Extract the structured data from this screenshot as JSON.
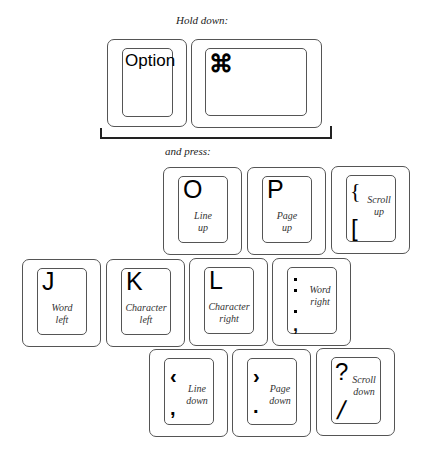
{
  "captions": {
    "hold_down": "Hold down:",
    "and_press": "and press:"
  },
  "modifiers": [
    {
      "id": "option",
      "label": "Option"
    },
    {
      "id": "command",
      "label": "⌘",
      "icon": "command-icon"
    }
  ],
  "keys": {
    "o": {
      "glyph": "O",
      "action_line1": "Line",
      "action_line2": "up"
    },
    "p": {
      "glyph": "P",
      "action_line1": "Page",
      "action_line2": "up"
    },
    "bracket": {
      "upper": "{",
      "lower": "[",
      "action_line1": "Scroll",
      "action_line2": "up"
    },
    "j": {
      "glyph": "J",
      "action_line1": "Word",
      "action_line2": "left"
    },
    "k": {
      "glyph": "K",
      "action_line1": "Character",
      "action_line2": "left"
    },
    "l": {
      "glyph": "L",
      "action_line1": "Character",
      "action_line2": "right"
    },
    "semicolon": {
      "upper": ":",
      "lower": ";",
      "action_line1": "Word",
      "action_line2": "right"
    },
    "comma": {
      "upper": "‹",
      "lower": ",",
      "action_line1": "Line",
      "action_line2": "down"
    },
    "period": {
      "upper": "›",
      "lower": ".",
      "action_line1": "Page",
      "action_line2": "down"
    },
    "slash": {
      "upper": "?",
      "lower": "/",
      "action_line1": "Scroll",
      "action_line2": "down"
    }
  }
}
